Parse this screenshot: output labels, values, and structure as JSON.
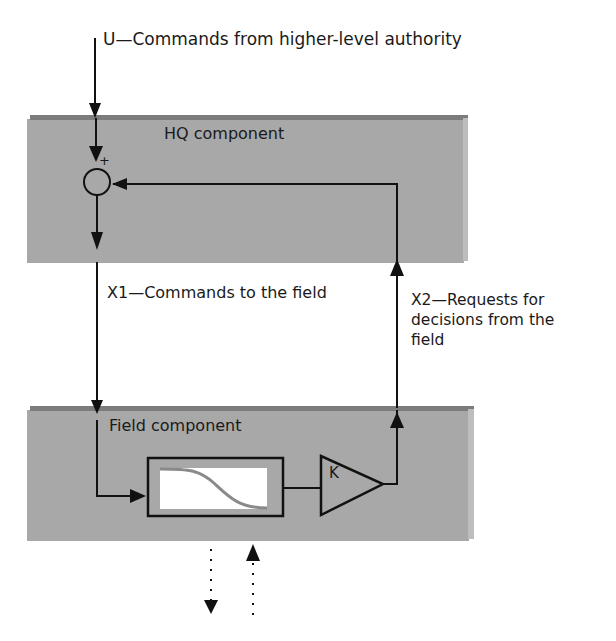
{
  "diagram": {
    "input_label": "U—Commands from higher-level authority",
    "hq_component": {
      "title": "HQ component",
      "summing_junction_sign": "+"
    },
    "x1_label": "X1—Commands to the field",
    "x2_label": "X2—Requests for decisions from the field",
    "x2_lines": [
      "X2—Requests for",
      "decisions from the",
      "field"
    ],
    "field_component": {
      "title": "Field component",
      "filter_block": "sigmoid-curve-block",
      "gain_label": "K"
    },
    "colors": {
      "slab": "#a8a8a8",
      "slab_top": "#7c7c7c",
      "line": "#111111",
      "curve": "#8a8a8a"
    }
  }
}
